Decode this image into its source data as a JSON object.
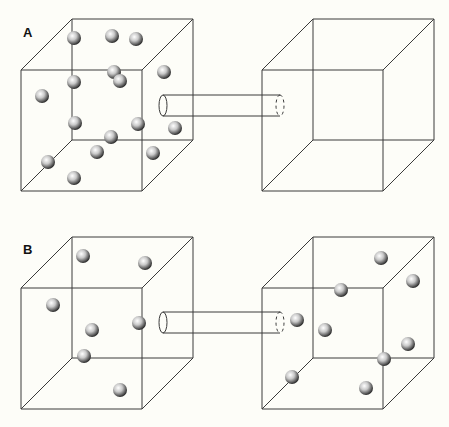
{
  "panels": [
    {
      "label": "A",
      "left_cube": {
        "front_tl": [
          21,
          70
        ],
        "size": 121,
        "depth": [
          51,
          -51
        ]
      },
      "right_cube": {
        "front_tl": [
          262,
          70
        ],
        "size": 121,
        "depth": [
          51,
          -51
        ]
      },
      "tube": {
        "x1": 163,
        "x2": 280,
        "y_top": 95,
        "y_bottom": 116
      },
      "left_particles": [
        [
          74,
          38
        ],
        [
          112,
          36
        ],
        [
          136,
          39
        ],
        [
          114,
          72
        ],
        [
          120,
          81
        ],
        [
          164,
          72
        ],
        [
          74,
          82
        ],
        [
          42,
          96
        ],
        [
          75,
          123
        ],
        [
          138,
          124
        ],
        [
          111,
          137
        ],
        [
          175,
          128
        ],
        [
          97,
          152
        ],
        [
          153,
          153
        ],
        [
          48,
          162
        ],
        [
          74,
          178
        ]
      ],
      "right_particles": []
    },
    {
      "label": "B",
      "left_cube": {
        "front_tl": [
          21,
          288
        ],
        "size": 121,
        "depth": [
          51,
          -51
        ]
      },
      "right_cube": {
        "front_tl": [
          262,
          288
        ],
        "size": 121,
        "depth": [
          51,
          -51
        ]
      },
      "tube": {
        "x1": 163,
        "x2": 280,
        "y_top": 312,
        "y_bottom": 333
      },
      "left_particles": [
        [
          83,
          256
        ],
        [
          145,
          263
        ],
        [
          53,
          305
        ],
        [
          92,
          330
        ],
        [
          139,
          323
        ],
        [
          84,
          356
        ],
        [
          120,
          390
        ]
      ],
      "right_particles": [
        [
          381,
          258
        ],
        [
          413,
          281
        ],
        [
          341,
          290
        ],
        [
          297,
          320
        ],
        [
          325,
          330
        ],
        [
          408,
          344
        ],
        [
          384,
          359
        ],
        [
          292,
          377
        ],
        [
          366,
          388
        ]
      ]
    }
  ],
  "particle_radius": 7,
  "colors": {
    "line": "#3a3a3a",
    "background": "#fdfdf8"
  }
}
